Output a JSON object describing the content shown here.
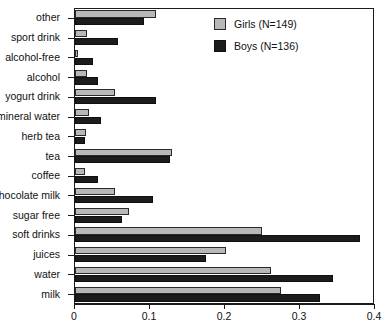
{
  "chart_data": {
    "type": "bar",
    "orientation": "horizontal",
    "title": "",
    "xlabel": "",
    "ylabel": "",
    "xlim": [
      0,
      0.4
    ],
    "xticks": [
      "0",
      "0.1",
      "0.2",
      "0.3",
      "0.4"
    ],
    "xtick_values": [
      0,
      0.1,
      0.2,
      0.3,
      0.4
    ],
    "grid": false,
    "legend_position": "top-right",
    "categories": [
      "other",
      "sport drink",
      "alcohol-free",
      "alcohol",
      "yogurt drink",
      "mineral water",
      "herb tea",
      "tea",
      "coffee",
      "chocolate milk",
      "sugar free",
      "soft drinks",
      "juices",
      "water",
      "milk"
    ],
    "series": [
      {
        "name": "Girls (N=149)",
        "color": "#b8b8b8",
        "values": [
          0.108,
          0.016,
          0.004,
          0.016,
          0.053,
          0.018,
          0.014,
          0.129,
          0.013,
          0.053,
          0.072,
          0.249,
          0.201,
          0.261,
          0.275
        ]
      },
      {
        "name": "Boys (N=136)",
        "color": "#1c1c1c",
        "values": [
          0.092,
          0.057,
          0.024,
          0.031,
          0.108,
          0.035,
          0.013,
          0.126,
          0.031,
          0.104,
          0.062,
          0.38,
          0.174,
          0.344,
          0.327
        ]
      }
    ]
  },
  "legend": {
    "items": [
      {
        "label": "Girls (N=149)",
        "swatch": "girls"
      },
      {
        "label": "Boys (N=136)",
        "swatch": "boys"
      }
    ]
  }
}
